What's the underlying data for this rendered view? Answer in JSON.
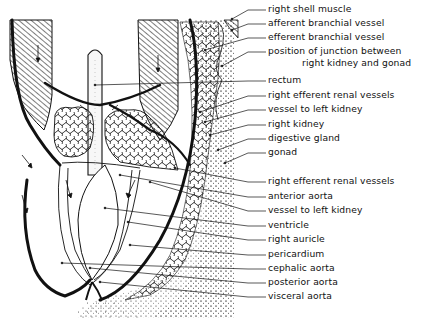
{
  "diagram": {
    "type": "anatomical line drawing",
    "labels": [
      {
        "id": "right-shell-muscle",
        "text": "right shell muscle",
        "y": 9,
        "leader_to": [
          232,
          19
        ]
      },
      {
        "id": "afferent-branchial-vessel",
        "text": "afferent branchial vessel",
        "y": 23,
        "leader_to": [
          232,
          30
        ]
      },
      {
        "id": "efferent-branchial-vessel",
        "text": "efferent branchial vessel",
        "y": 37,
        "leader_to": [
          205,
          50
        ]
      },
      {
        "id": "junction-kidney-gonad",
        "text": "position of junction between",
        "text2": "right kidney and gonad",
        "y": 51,
        "leader_to": [
          222,
          66
        ]
      },
      {
        "id": "rectum",
        "text": "rectum",
        "y": 80,
        "leader_to": [
          95,
          85
        ]
      },
      {
        "id": "right-efferent-renal-vessels-1",
        "text": "right efferent renal vessels",
        "y": 95,
        "leader_to": [
          200,
          112
        ]
      },
      {
        "id": "vessel-to-left-kidney-1",
        "text": "vessel to left kidney",
        "y": 109,
        "leader_to": [
          205,
          122
        ]
      },
      {
        "id": "right-kidney",
        "text": "right kidney",
        "y": 124,
        "leader_to": [
          210,
          135
        ]
      },
      {
        "id": "digestive-gland",
        "text": "digestive gland",
        "y": 138,
        "leader_to": [
          218,
          150
        ]
      },
      {
        "id": "gonad",
        "text": "gonad",
        "y": 152,
        "leader_to": [
          225,
          163
        ]
      },
      {
        "id": "right-efferent-renal-vessels-2",
        "text": "right efferent renal vessels",
        "y": 181,
        "leader_to": [
          175,
          168
        ]
      },
      {
        "id": "anterior-aorta",
        "text": "anterior aorta",
        "y": 196,
        "leader_to": [
          120,
          175
        ]
      },
      {
        "id": "vessel-to-left-kidney-2",
        "text": "vessel to left kidney",
        "y": 210,
        "leader_to": [
          150,
          182
        ]
      },
      {
        "id": "ventricle",
        "text": "ventricle",
        "y": 225,
        "leader_to": [
          105,
          208
        ]
      },
      {
        "id": "right-auricle",
        "text": "right auricle",
        "y": 239,
        "leader_to": [
          128,
          222
        ]
      },
      {
        "id": "pericardium",
        "text": "pericardium",
        "y": 254,
        "leader_to": [
          130,
          245
        ]
      },
      {
        "id": "cephalic-aorta",
        "text": "cephalic aorta",
        "y": 268,
        "leader_to": [
          62,
          263
        ]
      },
      {
        "id": "posterior-aorta",
        "text": "posterior aorta",
        "y": 282,
        "leader_to": [
          90,
          268
        ]
      },
      {
        "id": "visceral-aorta",
        "text": "visceral aorta",
        "y": 296,
        "leader_to": [
          100,
          282
        ]
      }
    ]
  }
}
